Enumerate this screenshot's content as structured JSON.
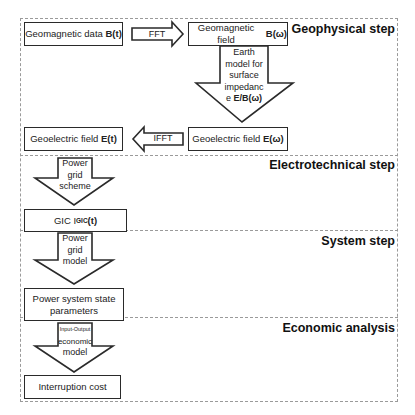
{
  "diagram": {
    "type": "flowchart",
    "sections": [
      {
        "title": "Geophysical step",
        "nodes": [
          {
            "id": "geomag_data",
            "label": "Geomagnetic data ",
            "symbol": "B(t)"
          },
          {
            "id": "geomag_field",
            "label": "Geomagnetic field ",
            "symbol": "B(ω)"
          },
          {
            "id": "geoelec_field_w",
            "label": "Geoelectric field ",
            "symbol": "E(ω)"
          },
          {
            "id": "geoelec_field_t",
            "label": "Geoelectric field ",
            "symbol": "E(t)"
          }
        ],
        "arrows": [
          {
            "from": "geomag_data",
            "to": "geomag_field",
            "label": "FFT",
            "direction": "right"
          },
          {
            "from": "geomag_field",
            "to": "geoelec_field_w",
            "label_lines": [
              "Earth",
              "model for",
              "surface",
              "impedanc"
            ],
            "label_last_prefix": "e ",
            "label_last_symbol": "E/B(ω)",
            "direction": "down"
          },
          {
            "from": "geoelec_field_w",
            "to": "geoelec_field_t",
            "label": "IFFT",
            "direction": "left"
          }
        ]
      },
      {
        "title": "Electrotechnical step",
        "arrow_label_lines": [
          "Power",
          "grid",
          "scheme"
        ],
        "node": {
          "label": "GIC I",
          "subscript": "GIC",
          "suffix": "(t)"
        }
      },
      {
        "title": "System step",
        "arrow_label_lines": [
          "Power",
          "grid",
          "model"
        ],
        "node": {
          "label_lines": [
            "Power system state",
            "parameters"
          ]
        }
      },
      {
        "title": "Economic analysis",
        "arrow_label_lines": [
          "Input-Output",
          "economic",
          "model"
        ],
        "node": {
          "label": "Interruption cost"
        }
      }
    ],
    "colors": {
      "stroke": "#2a2a2a",
      "dashed_border": "#9a9a9a",
      "background": "#ffffff",
      "text": "#1a1a1a"
    }
  }
}
